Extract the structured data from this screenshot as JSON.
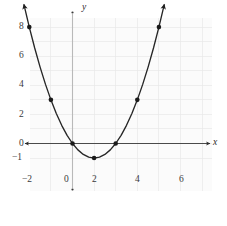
{
  "figure": {
    "background": "#ffffff",
    "plot_background": "#fbfbfb",
    "grid_color": "#e9e9e9",
    "axis_color": "#4a4a4a",
    "curve_color": "#262626",
    "point_color": "#1a1a1a"
  },
  "chart_data": {
    "type": "line",
    "title": "",
    "subtitle": "",
    "xlabel": "x",
    "ylabel": "y",
    "function": "y = x^2 - 2x",
    "xlim": [
      -3,
      6.6
    ],
    "ylim": [
      -1.8,
      9.2
    ],
    "grid": true,
    "legend": null,
    "x_ticks": [
      -2,
      0,
      2,
      4,
      6
    ],
    "x_tick_labels": [
      "−2",
      "0",
      "2",
      "4",
      "6"
    ],
    "y_ticks": [
      -1,
      0,
      2,
      4,
      6,
      8
    ],
    "y_tick_labels": [
      "−1",
      "0",
      "2",
      "4",
      "6",
      "8"
    ],
    "marked_points": [
      {
        "x": -2,
        "y": 8
      },
      {
        "x": -1,
        "y": 3
      },
      {
        "x": 0,
        "y": 0
      },
      {
        "x": 1,
        "y": -1
      },
      {
        "x": 2,
        "y": 0
      },
      {
        "x": 3,
        "y": 3
      },
      {
        "x": 4,
        "y": 8
      }
    ],
    "vertex": {
      "x": 1,
      "y": -1
    },
    "roots": [
      {
        "x": 0,
        "y": 0
      },
      {
        "x": 2,
        "y": 0
      }
    ],
    "curve_arrow_ends": [
      {
        "x": -2.2,
        "y": 9.24
      },
      {
        "x": 4.2,
        "y": 9.24
      }
    ],
    "curve_samples_x": [
      -2.25,
      -2.0,
      -1.75,
      -1.5,
      -1.25,
      -1.0,
      -0.75,
      -0.5,
      -0.25,
      0,
      0.25,
      0.5,
      0.75,
      1.0,
      1.25,
      1.5,
      1.75,
      2.0,
      2.25,
      2.5,
      2.75,
      3.0,
      3.25,
      3.5,
      3.75,
      4.0,
      4.25
    ],
    "axis_arrows": {
      "x_left": true,
      "x_right": true,
      "y_top": true,
      "y_bottom": true
    }
  },
  "labels": {
    "x_axis_name": "x",
    "y_axis_name": "y"
  }
}
